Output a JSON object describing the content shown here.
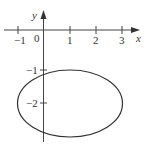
{
  "figure": {
    "axes": {
      "x_label": "x",
      "y_label": "y",
      "origin_label": "0",
      "x_ticks": [
        {
          "value": -1,
          "label": "−1",
          "px": 18
        },
        {
          "value": 1,
          "label": "1",
          "px": 70
        },
        {
          "value": 2,
          "label": "2",
          "px": 96
        },
        {
          "value": 3,
          "label": "3",
          "px": 122
        }
      ],
      "y_ticks": [
        {
          "value": -1,
          "label": "−1",
          "py": 70
        },
        {
          "value": -2,
          "label": "−2",
          "py": 103
        }
      ]
    },
    "ellipse": {
      "center": [
        1,
        -2
      ],
      "semi_axis_x": 2,
      "semi_axis_y": 1
    },
    "colors": {
      "axis": "#444444",
      "curve": "#333333",
      "text": "#333333"
    }
  }
}
